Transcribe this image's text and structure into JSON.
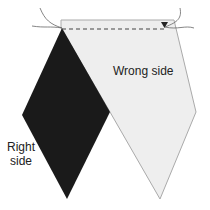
{
  "diagram": {
    "labels": {
      "wrong_side": "Wrong side",
      "right_side_line1": "Right",
      "right_side_line2": "side"
    },
    "colors": {
      "right_side_fabric": "#1a1a1a",
      "wrong_side_fabric": "#eeeeee",
      "outline": "#aaaaaa",
      "stitch_line": "#444444",
      "thread": "#666666"
    }
  }
}
